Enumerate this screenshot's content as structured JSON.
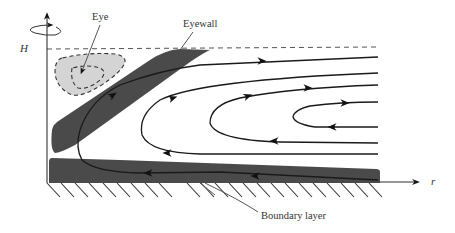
{
  "diagram": {
    "labels": {
      "eye": "Eye",
      "eyewall": "Eyewall",
      "boundary_layer": "Boundary layer",
      "height_axis": "H",
      "radius_axis": "r"
    },
    "colors": {
      "eyewall_fill": "#4a4a4a",
      "boundary_layer_fill": "#4a4a4a",
      "eye_fill": "#d4d4d4",
      "stroke": "#1a1a1a",
      "background": "#ffffff"
    },
    "elements": [
      "vertical-axis-with-rotation-arrow",
      "radial-axis",
      "ground-hatching",
      "tropopause-dashed-line",
      "eye-region-dashed",
      "eyewall-band",
      "boundary-layer-slab",
      "streamlines"
    ]
  }
}
